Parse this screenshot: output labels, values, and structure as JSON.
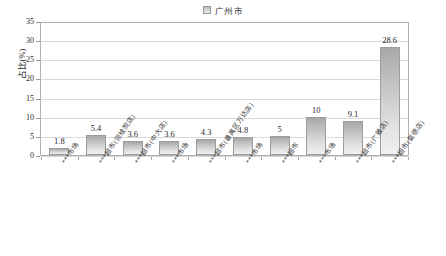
{
  "legend": {
    "entries": [
      {
        "label": "广州市",
        "swatch_color": "#c9c9c9"
      }
    ],
    "position": "top-center"
  },
  "axes": {
    "ylabel": "占比(%)",
    "yticks": [
      "35",
      "30",
      "25",
      "20",
      "15",
      "10",
      "5",
      "0"
    ],
    "xlabel": ""
  },
  "chart_data": {
    "type": "bar",
    "title": "",
    "subtitle": "",
    "xlabel": "",
    "ylabel": "占比(%)",
    "ylim": [
      0,
      35
    ],
    "ytick_step": 5,
    "grid": true,
    "legend_position": "top-center",
    "series_name": "广州市",
    "bar_color": "#c9c9c9",
    "categories": [
      "***市场",
      "***超市(测绘院店)",
      "***超市(中大店)",
      "***市场",
      "***超市(番禺区万达店)",
      "***市场",
      "***超市",
      "***市场",
      "***超市(广雅店)",
      "***超市(棠德店)"
    ],
    "values": [
      1.8,
      5.4,
      3.6,
      3.6,
      4.3,
      4.8,
      5,
      10,
      9.1,
      28.6
    ],
    "data_labels": [
      "1.8",
      "5.4",
      "3.6",
      "3.6",
      "4.3",
      "4.8",
      "5",
      "10",
      "9.1",
      "28.6"
    ],
    "series": [
      {
        "name": "广州市",
        "values": [
          1.8,
          5.4,
          3.6,
          3.6,
          4.3,
          4.8,
          5,
          10,
          9.1,
          28.6
        ]
      }
    ]
  }
}
